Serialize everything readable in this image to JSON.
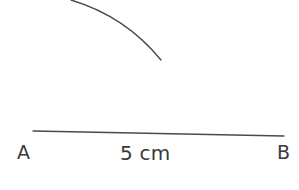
{
  "figure": {
    "kind": "geometry-construction",
    "background_color": "#ffffff",
    "ink_color": "#4a4a4a",
    "text_color": "#3a3a3a"
  },
  "labels": {
    "point_a": "A",
    "point_b": "B",
    "segment_length": "5 cm"
  },
  "elements": {
    "arc": {
      "name": "compass-arc",
      "stroke_width": 1.4,
      "start": {
        "x": 71,
        "y": 0
      },
      "end": {
        "x": 161,
        "y": 60
      },
      "path": "M 71 0 Q 125 16 161 60",
      "clipped_at_top": true
    },
    "segment": {
      "name": "line-segment-ab",
      "stroke_width": 1.3,
      "start": {
        "x": 33,
        "y": 131
      },
      "end": {
        "x": 284,
        "y": 136
      },
      "path": "M 33 131 L 284 136"
    }
  },
  "measurements": {
    "value": 5,
    "unit": "cm"
  }
}
